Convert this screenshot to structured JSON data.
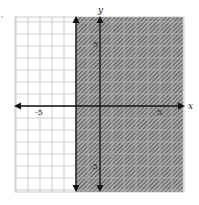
{
  "chart_data": {
    "type": "inequality-graph",
    "title": "",
    "inequality": "x >= -2",
    "boundary": {
      "type": "vertical-line",
      "x": -2,
      "style": "solid",
      "arrows": true
    },
    "shaded_region": "x >= -2 (right of boundary)",
    "xlabel": "x",
    "ylabel": "y",
    "xlim": [
      -7,
      7
    ],
    "ylim": [
      -7,
      7
    ],
    "grid": true,
    "grid_step": 1,
    "x_tick_labels": [
      {
        "value": -5,
        "label": "-5"
      },
      {
        "value": 5,
        "label": "5"
      }
    ],
    "y_tick_labels": [
      {
        "value": 5,
        "label": "5"
      },
      {
        "value": -5,
        "label": "-5"
      }
    ]
  },
  "labels": {
    "x_axis": "x",
    "y_axis": "y",
    "x_neg5": "-5",
    "x_pos5": "5",
    "y_pos5": "5",
    "y_neg5": "-5"
  },
  "colors": {
    "grid": "#b8b8b8",
    "axis": "#111111",
    "shade_bg": "#9a9a9a",
    "shade_hatch": "#3a3a3a"
  }
}
